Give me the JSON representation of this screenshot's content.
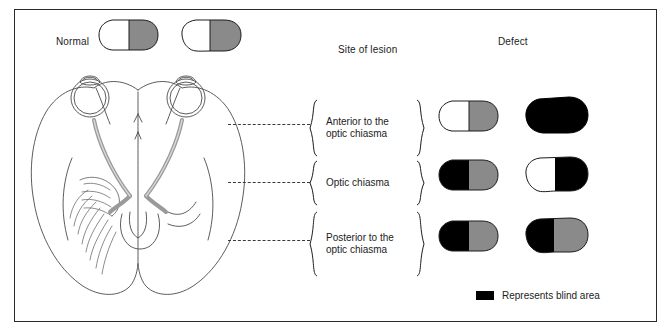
{
  "figure": {
    "headers": {
      "normal": "Normal",
      "site_of_lesion": "Site of lesion",
      "defect": "Defect"
    },
    "legend": {
      "label": "Represents blind area",
      "swatch_color": "#000000"
    },
    "colors": {
      "blind": "#000000",
      "shaded": "#8a8a8a",
      "seeing": "#ffffff",
      "outline": "#1c1c1c",
      "nerve": "#9a9a9a"
    },
    "normal_fields": [
      {
        "name": "left-eye-normal-field",
        "nasal": "seeing",
        "temporal": "shaded"
      },
      {
        "name": "right-eye-normal-field",
        "nasal": "seeing",
        "temporal": "shaded"
      }
    ],
    "rows": [
      {
        "id": "anterior",
        "lesion_label": "Anterior to the\noptic chiasma",
        "left_field": {
          "inner": "seeing",
          "outer": "shaded",
          "whole": null
        },
        "right_field": {
          "inner": null,
          "outer": null,
          "whole": "blind"
        }
      },
      {
        "id": "chiasma",
        "lesion_label": "Optic chiasma",
        "left_field": {
          "inner": "blind",
          "outer": "shaded",
          "whole": null
        },
        "right_field": {
          "inner": "seeing",
          "outer": "blind",
          "whole": null
        }
      },
      {
        "id": "posterior",
        "lesion_label": "Posterior to the\noptic chiasma",
        "left_field": {
          "inner": "blind",
          "outer": "shaded",
          "whole": null
        },
        "right_field": {
          "inner": "blind",
          "outer": "shaded",
          "whole": null
        }
      }
    ]
  }
}
